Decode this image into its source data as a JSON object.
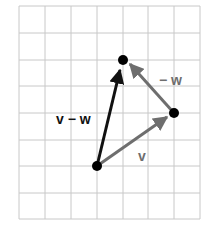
{
  "diagram": {
    "title": "",
    "grid": {
      "columns": 7,
      "rows": 8,
      "line_color": "#c8c8c8"
    },
    "points": [
      {
        "id": "origin",
        "col": 3,
        "row": 6
      },
      {
        "id": "v_tip",
        "col": 6,
        "row": 4
      },
      {
        "id": "vw_tip",
        "col": 4,
        "row": 2
      }
    ],
    "vectors": [
      {
        "id": "v",
        "label": "v",
        "from": "origin",
        "to": "v_tip",
        "color": "#6e6e6e"
      },
      {
        "id": "neg_w",
        "label": "− w",
        "from": "v_tip",
        "to": "vw_tip",
        "color": "#6e6e6e"
      },
      {
        "id": "v_minus_w",
        "label": "v − w",
        "from": "origin",
        "to": "vw_tip",
        "color": "#111111"
      }
    ],
    "labels": {
      "v": "v",
      "neg_w": "− w",
      "v_minus_w": "v − w"
    }
  }
}
